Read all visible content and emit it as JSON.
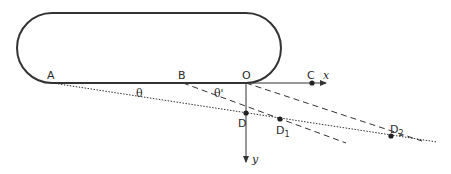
{
  "diagram": {
    "type": "geometry",
    "colors": {
      "stroke": "#333333",
      "background": "#ffffff"
    },
    "shape": {
      "name": "stadium",
      "left": 17,
      "top": 13,
      "right": 281,
      "bottom": 83,
      "radius": 35
    },
    "points": {
      "A": {
        "label": "A",
        "x": 52,
        "y": 83
      },
      "B": {
        "label": "B",
        "x": 183,
        "y": 83
      },
      "O": {
        "label": "O",
        "x": 246,
        "y": 83
      },
      "C": {
        "label": "C",
        "x": 312,
        "y": 83
      },
      "D": {
        "label": "D",
        "x": 246,
        "y": 113
      },
      "D1": {
        "label": "D",
        "sub": "1",
        "x": 280,
        "y": 119
      },
      "D2": {
        "label": "D",
        "sub": "2",
        "x": 391,
        "y": 136
      }
    },
    "axes": {
      "x": {
        "label": "x"
      },
      "y": {
        "label": "y"
      }
    },
    "angles": {
      "theta": {
        "label": "θ"
      },
      "theta_prime": {
        "label": "θ'"
      }
    },
    "lines": [
      {
        "name": "A-line",
        "style": "dotted",
        "from": "A",
        "through": [
          "D",
          "D1",
          "D2"
        ]
      },
      {
        "name": "B-line",
        "style": "dashed",
        "from": "B",
        "through": [
          "D1"
        ]
      },
      {
        "name": "O-line",
        "style": "dashed",
        "from": "O",
        "through": [
          "D2"
        ]
      }
    ]
  }
}
